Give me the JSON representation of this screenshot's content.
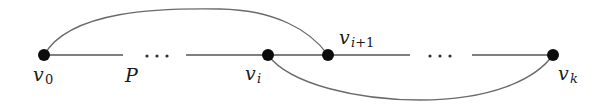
{
  "diagram": {
    "path_label": "P",
    "ellipsis": "···",
    "nodes": [
      {
        "id": "v0",
        "base": "v",
        "subscript": "0",
        "x": 44,
        "y": 55
      },
      {
        "id": "vi",
        "base": "v",
        "subscript": "i",
        "x": 268,
        "y": 55
      },
      {
        "id": "vi1",
        "base": "v",
        "subscript": "i+1",
        "x": 328,
        "y": 55
      },
      {
        "id": "vk",
        "base": "v",
        "subscript": "k",
        "x": 553,
        "y": 55
      }
    ],
    "edges": [
      {
        "from": "v0",
        "to": "...",
        "type": "path-segment"
      },
      {
        "from": "...",
        "to": "vi",
        "type": "path-segment"
      },
      {
        "from": "vi",
        "to": "vi1",
        "type": "path-edge"
      },
      {
        "from": "vi1",
        "to": "...",
        "type": "path-segment"
      },
      {
        "from": "...",
        "to": "vk",
        "type": "path-segment"
      },
      {
        "from": "v0",
        "to": "vi1",
        "type": "arc-above"
      },
      {
        "from": "vi",
        "to": "vk",
        "type": "arc-below"
      }
    ],
    "colors": {
      "node": "#0d0d0d",
      "edge": "#555555",
      "arc": "#6a6a6a",
      "background": "#ffffff"
    }
  }
}
